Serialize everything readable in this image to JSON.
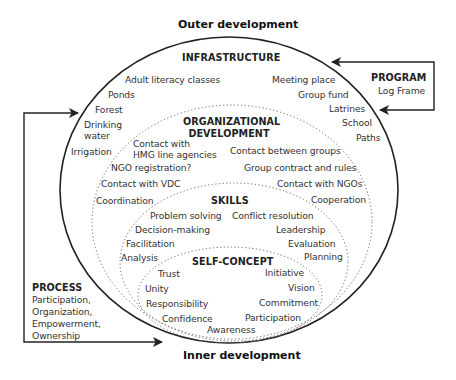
{
  "titles": {
    "outer": "Outer development",
    "inner": "Inner development"
  },
  "program": {
    "heading": "PROGRAM",
    "text": "Log Frame"
  },
  "process": {
    "heading": "PROCESS",
    "lines": [
      "Participation,",
      "Organization,",
      "Empowerment,",
      "Ownership"
    ]
  },
  "infrastructure": {
    "heading": "INFRASTRUCTURE",
    "left": [
      "Adult literacy classes",
      "Ponds",
      "Forest",
      "Drinking",
      "water",
      "Irrigation"
    ],
    "right": [
      "Meeting place",
      "Group fund",
      "Latrines",
      "School",
      "Paths"
    ]
  },
  "organizational": {
    "heading_line1": "ORGANIZATIONAL",
    "heading_line2": "DEVELOPMENT",
    "left": [
      "Contact with",
      "HMG line agencies",
      "NGO registration?",
      "Contact with VDC",
      "Coordination"
    ],
    "right": [
      "Contact between groups",
      "Group contract and rules",
      "Contact with NGOs",
      "Cooperation"
    ]
  },
  "skills": {
    "heading": "SKILLS",
    "left": [
      "Problem solving",
      "Decision-making",
      "Facilitation",
      "Analysis"
    ],
    "right": [
      "Conflict resolution",
      "Leadership",
      "Evaluation",
      "Planning"
    ]
  },
  "self_concept": {
    "heading": "SELF-CONCEPT",
    "left": [
      "Trust",
      "Unity",
      "Responsibility",
      "Confidence"
    ],
    "right": [
      "Initiative",
      "Vision",
      "Commitment",
      "Participation"
    ],
    "bottom": "Awareness"
  },
  "colors": {
    "line": "#222222",
    "dotted": "#666666",
    "text": "#333333"
  }
}
